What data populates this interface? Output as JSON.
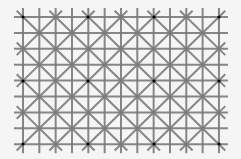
{
  "figure": {
    "name": "Ninio extinction illusion grid",
    "background": "#f5f5f5",
    "line_color": "#7a7a7a",
    "dot_color": "#000000",
    "line_width": 2,
    "grid": {
      "x0": 23,
      "y0": 17,
      "cols": 12,
      "rows": 8,
      "dx": 16.33,
      "dy": 15.9,
      "overhang": 9
    },
    "dots": [
      {
        "x": 23,
        "y": 17
      },
      {
        "x": 88,
        "y": 17
      },
      {
        "x": 154,
        "y": 17
      },
      {
        "x": 219,
        "y": 17
      },
      {
        "x": 23,
        "y": 81
      },
      {
        "x": 88,
        "y": 81
      },
      {
        "x": 154,
        "y": 81
      },
      {
        "x": 219,
        "y": 81
      },
      {
        "x": 23,
        "y": 144
      },
      {
        "x": 88,
        "y": 144
      },
      {
        "x": 154,
        "y": 144
      },
      {
        "x": 219,
        "y": 144
      }
    ]
  }
}
